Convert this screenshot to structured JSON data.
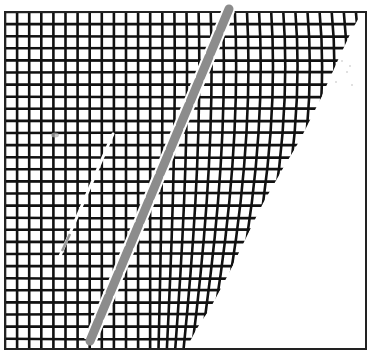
{
  "diagram": {
    "kind": "deformed-grid-illustration",
    "description": "Square wire-mesh grid inside a rectangular frame; the grid deflects and fans out toward the right, with a curved right edge leaving an empty white region. A thick gray dashed diagonal band and a thin white diagonal line cross the grid.",
    "frame": {
      "x": 5,
      "y": 12,
      "width": 361,
      "height": 337,
      "stroke": "#222222",
      "stroke_width": 2
    },
    "grid": {
      "origin_x": 5,
      "origin_y": 12,
      "cell": 12.1,
      "cols": 30,
      "rows": 28,
      "line_color": "#111111",
      "line_width": 2.6
    },
    "boundary": {
      "description": "Right edge of the grid region; curves from top-right toward bottom-center",
      "points": [
        [
          362,
          12
        ],
        [
          352,
          30
        ],
        [
          338,
          60
        ],
        [
          320,
          100
        ],
        [
          300,
          140
        ],
        [
          282,
          170
        ],
        [
          262,
          205
        ],
        [
          245,
          240
        ],
        [
          228,
          275
        ],
        [
          212,
          305
        ],
        [
          196,
          330
        ],
        [
          186,
          349
        ]
      ]
    },
    "fan": {
      "description": "Columns to the right of this x start leaning rightward; lean grows with distance",
      "start_x": 150,
      "max_lean": 0.35
    },
    "gray_band": {
      "color": "#8c8c8c",
      "width": 9,
      "dash": "22 4",
      "from": [
        229,
        9
      ],
      "to": [
        90,
        341
      ]
    },
    "white_line": {
      "color": "#ffffff",
      "width": 3,
      "from": [
        113,
        134
      ],
      "to": [
        60,
        256
      ]
    },
    "white_line_tip": {
      "color": "#9a9a9a",
      "from": [
        70,
        234
      ],
      "to": [
        62,
        251
      ]
    },
    "smudge": {
      "x": 55,
      "y": 135,
      "color": "#b0b0b0"
    },
    "speckles": [
      [
        342,
        61
      ],
      [
        350,
        66
      ],
      [
        347,
        72
      ],
      [
        336,
        82
      ],
      [
        352,
        85
      ]
    ]
  }
}
